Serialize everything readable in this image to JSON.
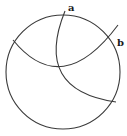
{
  "diagram": {
    "type": "geometric-construction",
    "stroke_color": "#3a3a3a",
    "background": "#ffffff",
    "circle": {
      "cx": 63,
      "cy": 72,
      "r": 57
    },
    "arcs": [
      {
        "name": "arc-through-b",
        "path": "M 13 40 Q 62 100 118 25"
      },
      {
        "name": "arc-through-a",
        "path": "M 65 11 Q 33 90 116 102"
      }
    ],
    "labels": [
      {
        "id": "a",
        "text": "a",
        "x": 68,
        "y": 11
      },
      {
        "id": "b",
        "text": "b",
        "x": 117,
        "y": 46
      }
    ]
  }
}
